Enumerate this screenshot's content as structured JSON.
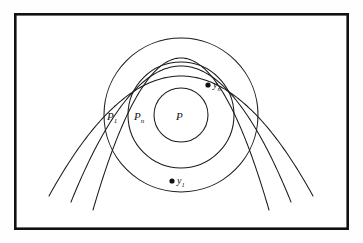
{
  "figure": {
    "background_color": "#fefefe",
    "frame": {
      "stroke_color": "#111111",
      "x": 14,
      "y": 13,
      "width": 335,
      "height": 217
    },
    "center": {
      "x": 181,
      "y": 115
    },
    "circles": [
      {
        "name": "inner-circle",
        "radius": 27,
        "label": "P",
        "subscript": ""
      },
      {
        "name": "middle-circle",
        "radius": 53,
        "label": "P",
        "subscript": "n"
      },
      {
        "name": "outer-circle",
        "radius": 77,
        "label": "P",
        "subscript": "1"
      }
    ],
    "region_labels": [
      {
        "name": "label-P1",
        "base": "P",
        "subscript": "1",
        "x": 107,
        "y": 120
      },
      {
        "name": "label-Pn",
        "base": "P",
        "subscript": "n",
        "x": 134,
        "y": 120
      },
      {
        "name": "label-P",
        "base": "P",
        "subscript": "",
        "x": 176,
        "y": 120
      }
    ],
    "points": [
      {
        "name": "point-yn",
        "base": "y",
        "subscript": "n",
        "dot_x": 208,
        "dot_y": 85,
        "label_x": 213,
        "label_y": 88
      },
      {
        "name": "point-y1",
        "base": "y",
        "subscript": "1",
        "dot_x": 172,
        "dot_y": 181,
        "label_x": 177,
        "label_y": 184
      }
    ],
    "parabolas": [
      {
        "name": "parabola-outer",
        "apex_x": 181,
        "apex_y": 76,
        "half_width": 132,
        "depth": 120
      },
      {
        "name": "parabola-middle",
        "apex_x": 181,
        "apex_y": 66,
        "half_width": 110,
        "depth": 136
      },
      {
        "name": "parabola-inner",
        "apex_x": 181,
        "apex_y": 58,
        "half_width": 88,
        "depth": 152
      }
    ]
  },
  "chart_data": {
    "type": "diagram",
    "title": "",
    "series": [
      {
        "name": "inner-circle",
        "kind": "circle",
        "cx": 181,
        "cy": 115,
        "r": 27
      },
      {
        "name": "middle-circle",
        "kind": "circle",
        "cx": 181,
        "cy": 115,
        "r": 53
      },
      {
        "name": "outer-circle",
        "kind": "circle",
        "cx": 181,
        "cy": 115,
        "r": 77
      },
      {
        "name": "parabola-outer",
        "kind": "parabola",
        "apex": [
          181,
          76
        ],
        "opens": "down"
      },
      {
        "name": "parabola-middle",
        "kind": "parabola",
        "apex": [
          181,
          66
        ],
        "opens": "down"
      },
      {
        "name": "parabola-inner",
        "kind": "parabola",
        "apex": [
          181,
          58
        ],
        "opens": "down"
      }
    ],
    "annotations": [
      {
        "text": "P1",
        "x": 107,
        "y": 120
      },
      {
        "text": "Pn",
        "x": 134,
        "y": 120
      },
      {
        "text": "P",
        "x": 176,
        "y": 120
      },
      {
        "text": "yn",
        "x": 213,
        "y": 88
      },
      {
        "text": "y1",
        "x": 177,
        "y": 184
      }
    ],
    "xlabel": "",
    "ylabel": "",
    "grid": false,
    "legend": null
  }
}
